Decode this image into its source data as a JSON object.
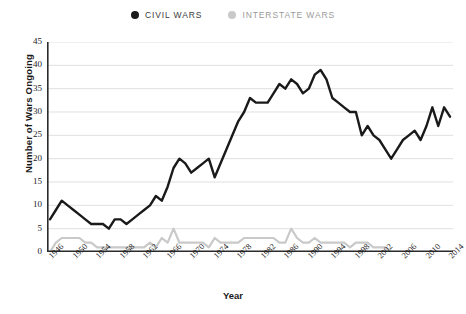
{
  "legend": {
    "position": "top-center",
    "entries": [
      {
        "label": "CIVIL WARS",
        "color": "#1a1a1a",
        "marker": "circle-dot-icon"
      },
      {
        "label": "INTERSTATE WARS",
        "color": "#c9c9c9",
        "marker": "circle-dot-icon"
      }
    ]
  },
  "axes": {
    "y_title": "Number of Wars Ongoing",
    "x_title": "Year",
    "y_ticks": [
      0,
      5,
      10,
      15,
      20,
      25,
      30,
      35,
      40,
      45
    ],
    "x_ticks": [
      1946,
      1950,
      1954,
      1958,
      1962,
      1966,
      1970,
      1974,
      1978,
      1982,
      1986,
      1990,
      1994,
      1998,
      2002,
      2006,
      2010,
      2014
    ]
  },
  "chart_data": {
    "type": "line",
    "title": "",
    "subtitle": "",
    "xlabel": "Year",
    "ylabel": "Number of Wars Ongoing",
    "xlim": [
      1946,
      2014
    ],
    "ylim": [
      0,
      45
    ],
    "grid": "horizontal",
    "legend_position": "top-center",
    "x": [
      1946,
      1947,
      1948,
      1949,
      1950,
      1951,
      1952,
      1953,
      1954,
      1955,
      1956,
      1957,
      1958,
      1959,
      1960,
      1961,
      1962,
      1963,
      1964,
      1965,
      1966,
      1967,
      1968,
      1969,
      1970,
      1971,
      1972,
      1973,
      1974,
      1975,
      1976,
      1977,
      1978,
      1979,
      1980,
      1981,
      1982,
      1983,
      1984,
      1985,
      1986,
      1987,
      1988,
      1989,
      1990,
      1991,
      1992,
      1993,
      1994,
      1995,
      1996,
      1997,
      1998,
      1999,
      2000,
      2001,
      2002,
      2003,
      2004,
      2005,
      2006,
      2007,
      2008,
      2009,
      2010,
      2011,
      2012,
      2013,
      2014
    ],
    "series": [
      {
        "name": "CIVIL WARS",
        "color": "#1a1a1a",
        "values": [
          7,
          9,
          11,
          10,
          9,
          8,
          7,
          6,
          6,
          6,
          5,
          7,
          7,
          6,
          7,
          8,
          9,
          10,
          12,
          11,
          14,
          18,
          20,
          19,
          17,
          18,
          19,
          20,
          16,
          19,
          22,
          25,
          28,
          30,
          33,
          32,
          32,
          32,
          34,
          36,
          35,
          37,
          36,
          34,
          35,
          38,
          39,
          37,
          33,
          32,
          31,
          30,
          30,
          25,
          27,
          25,
          24,
          22,
          20,
          22,
          24,
          25,
          26,
          24,
          27,
          31,
          27,
          31,
          29
        ]
      },
      {
        "name": "INTERSTATE WARS",
        "color": "#c9c9c9",
        "values": [
          0,
          2,
          3,
          3,
          3,
          3,
          2,
          2,
          1,
          1,
          1,
          1,
          1,
          1,
          1,
          1,
          1,
          2,
          1,
          3,
          2,
          5,
          2,
          2,
          2,
          2,
          2,
          1,
          3,
          2,
          2,
          2,
          2,
          3,
          3,
          3,
          3,
          3,
          3,
          2,
          2,
          5,
          3,
          2,
          2,
          3,
          2,
          2,
          2,
          2,
          2,
          1,
          2,
          2,
          2,
          1,
          1,
          1,
          0,
          0,
          0,
          0,
          0,
          0,
          0,
          0,
          0,
          0,
          0
        ]
      }
    ]
  }
}
